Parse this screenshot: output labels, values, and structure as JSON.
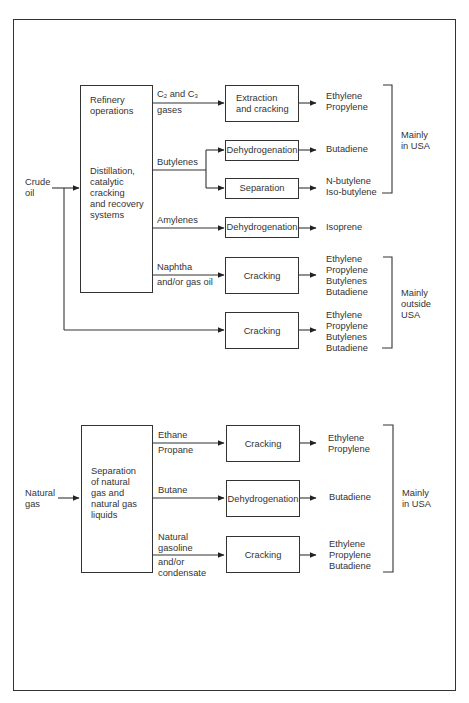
{
  "crude": {
    "input_label_1": "Crude",
    "input_label_2": "oil",
    "source_box": {
      "line1": "Refinery",
      "line2": "operations",
      "line3": "Distillation,",
      "line4": "catalytic",
      "line5": "cracking",
      "line6": "and recovery",
      "line7": "systems"
    },
    "streams": {
      "c2c3_a": "C",
      "c2c3_sub1": "2",
      "c2c3_b": " and C",
      "c2c3_sub2": "3",
      "c2c3_line2": "gases",
      "butylenes": "Butylenes",
      "amylenes": "Amylenes",
      "naphtha_1": "Naphtha",
      "naphtha_2": "and/or gas oil"
    },
    "processes": {
      "extraction_1": "Extraction",
      "extraction_2": "and cracking",
      "dehydrogenation_1": "Dehydrogenation",
      "separation": "Separation",
      "dehydrogenation_2": "Dehydrogenation",
      "cracking_1": "Cracking",
      "cracking_2": "Cracking"
    },
    "products": {
      "p1": [
        "Ethylene",
        "Propylene"
      ],
      "p2": [
        "Butadiene"
      ],
      "p3": [
        "N-butylene",
        "Iso-butylene"
      ],
      "p4": [
        "Isoprene"
      ],
      "p5": [
        "Ethylene",
        "Propylene",
        "Butylenes",
        "Butadiene"
      ],
      "p6": [
        "Ethylene",
        "Propylene",
        "Butylenes",
        "Butadiene"
      ]
    },
    "regions": {
      "usa_1": "Mainly",
      "usa_2": "in USA",
      "outside_1": "Mainly",
      "outside_2": "outside",
      "outside_3": "USA"
    }
  },
  "natural_gas": {
    "input_label_1": "Natural",
    "input_label_2": "gas",
    "source_box": {
      "line1": "Separation",
      "line2": "of natural",
      "line3": "gas and",
      "line4": "natural gas",
      "line5": "liquids"
    },
    "streams": {
      "ethane": "Ethane",
      "propane": "Propane",
      "butane": "Butane",
      "natgasoline_1": "Natural",
      "natgasoline_2": "gasoline",
      "natgasoline_3": "and/or",
      "natgasoline_4": "condensate"
    },
    "processes": {
      "cracking_1": "Cracking",
      "dehydrogenation": "Dehydrogenation",
      "cracking_2": "Cracking"
    },
    "products": {
      "p1": [
        "Ethylene",
        "Propylene"
      ],
      "p2": [
        "Butadiene"
      ],
      "p3": [
        "Ethylene",
        "Propylene",
        "Butadiene"
      ]
    },
    "regions": {
      "usa_1": "Mainly",
      "usa_2": "in USA"
    }
  }
}
